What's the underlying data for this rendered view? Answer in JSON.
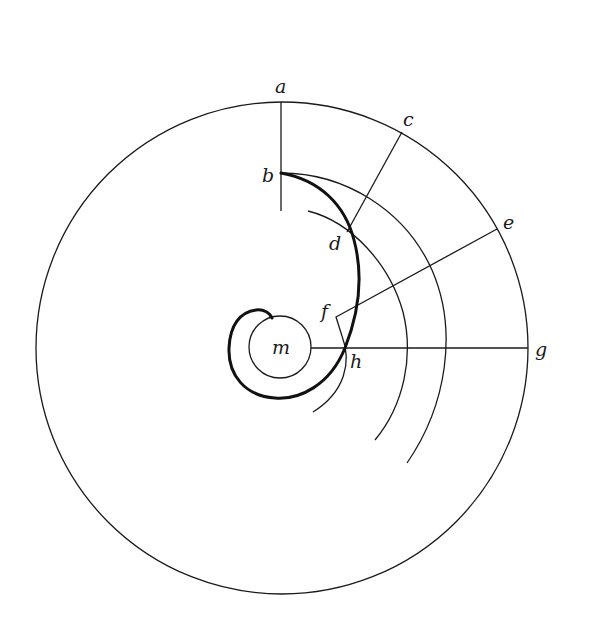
{
  "diagram": {
    "labels": {
      "a": "a",
      "b": "b",
      "c": "c",
      "d": "d",
      "e": "e",
      "f": "f",
      "g": "g",
      "h": "h",
      "m": "m"
    },
    "colors": {
      "background": "#ffffff",
      "stroke": "#1a1a1a"
    }
  }
}
